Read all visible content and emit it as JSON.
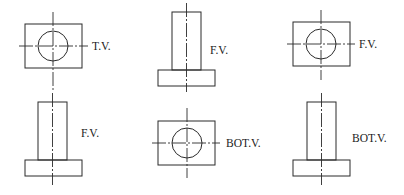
{
  "diagram": {
    "views": [
      {
        "id": "view-1",
        "type": "square-block-with-circle",
        "label": "T.V."
      },
      {
        "id": "view-2",
        "type": "stepped-shaft",
        "label": "F.V."
      },
      {
        "id": "view-3",
        "type": "square-block-with-circle",
        "label": "F.V."
      },
      {
        "id": "view-4",
        "type": "stepped-shaft",
        "label": "F.V."
      },
      {
        "id": "view-5",
        "type": "square-block-with-circle",
        "label": "BOT.V."
      },
      {
        "id": "view-6",
        "type": "stepped-shaft",
        "label": "BOT.V."
      }
    ],
    "colors": {
      "line": "#2a2a2a",
      "text": "#222222",
      "background": "#ffffff"
    }
  }
}
